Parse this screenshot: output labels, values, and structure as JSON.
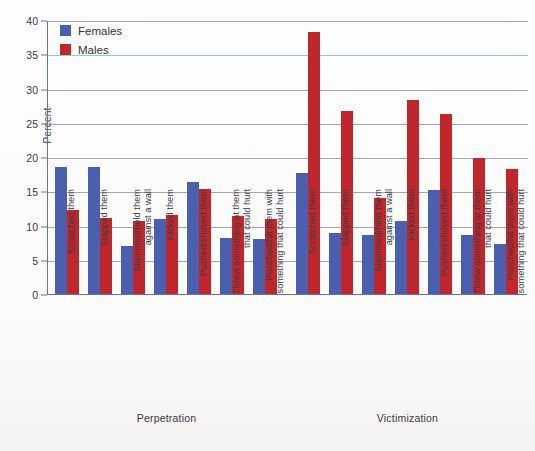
{
  "chart_data": {
    "type": "bar",
    "title": "",
    "xlabel": "",
    "ylabel": "Percent",
    "ylim": [
      0,
      40
    ],
    "yticks": [
      0,
      5,
      10,
      15,
      20,
      25,
      30,
      35,
      40
    ],
    "grid": true,
    "legend_position": "top-left",
    "legend": [
      "Females",
      "Males"
    ],
    "groups": [
      {
        "name": "Perpetration",
        "categories": [
          "Scratched them",
          "Slapped them",
          "Slammed/held them against a wall",
          "Kicked them",
          "Pushed/shoved them",
          "Threw something at them that could hurt",
          "Punched/hit them with something that could hurt"
        ],
        "series": [
          {
            "name": "Females",
            "values": [
              18.5,
              18.5,
              7.0,
              10.9,
              16.3,
              8.2,
              8.0
            ]
          },
          {
            "name": "Males",
            "values": [
              12.3,
              11.1,
              10.7,
              11.6,
              15.4,
              11.4,
              10.9
            ]
          }
        ]
      },
      {
        "name": "Victimization",
        "categories": [
          "Scratched them",
          "Slapped them",
          "Slammed/held them against a wall",
          "Kicked them",
          "Pushed/shoved them",
          "Threw something at them that could hurt",
          "Punched/hit them with something that could hurt"
        ],
        "series": [
          {
            "name": "Females",
            "values": [
              17.7,
              8.9,
              8.6,
              10.6,
              15.2,
              8.6,
              7.3
            ]
          },
          {
            "name": "Males",
            "values": [
              38.2,
              26.7,
              14.0,
              28.3,
              26.3,
              19.9,
              18.2
            ]
          }
        ]
      }
    ],
    "colors": {
      "Females": "#4a5fae",
      "Males": "#c0272d",
      "grid": "#8f93c4",
      "axis": "#6b6fa8"
    }
  },
  "axis": {
    "y_title": "Percent",
    "tick_labels": [
      "0",
      "5",
      "10",
      "15",
      "20",
      "25",
      "30",
      "35",
      "40"
    ]
  },
  "legend": {
    "items": [
      {
        "label": "Females",
        "color": "#4a5fae"
      },
      {
        "label": "Males",
        "color": "#c0272d"
      }
    ]
  },
  "captions": {
    "perpetration": "Perpetration",
    "victimization": "Victimization"
  }
}
